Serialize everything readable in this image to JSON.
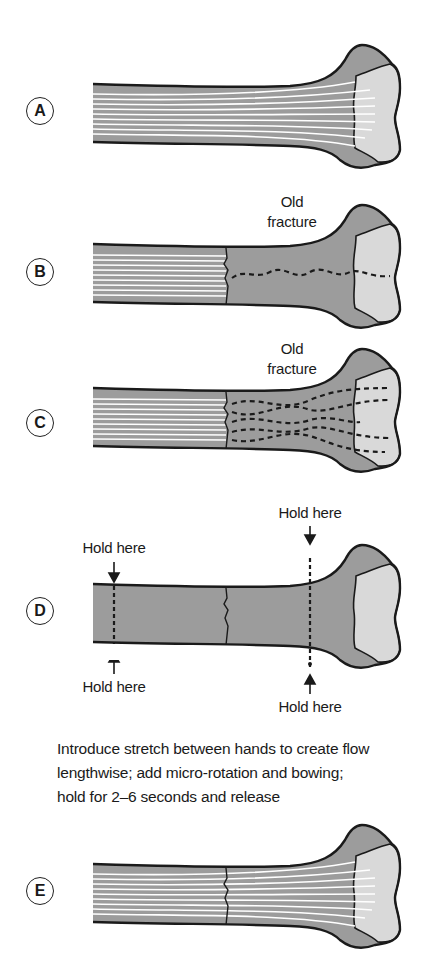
{
  "figure": {
    "panels": [
      {
        "id": "A",
        "label": "A",
        "annotations": []
      },
      {
        "id": "B",
        "label": "B",
        "annotations": [
          "Old",
          "fracture"
        ]
      },
      {
        "id": "C",
        "label": "C",
        "annotations": [
          "Old",
          "fracture"
        ]
      },
      {
        "id": "D",
        "label": "D",
        "annotations": [
          "Hold here",
          "Hold here",
          "Hold here",
          "Hold here"
        ]
      },
      {
        "id": "E",
        "label": "E",
        "annotations": []
      }
    ],
    "instruction": {
      "line1": "Introduce stretch between hands to create flow",
      "line2": "lengthwise; add micro-rotation and bowing;",
      "line3": "hold for 2–6 seconds and release"
    },
    "colors": {
      "cortex_gray": "#9c9c9c",
      "head_light": "#d9d9d9",
      "outline": "#1a1a1a",
      "fiber_white": "#ffffff"
    }
  }
}
